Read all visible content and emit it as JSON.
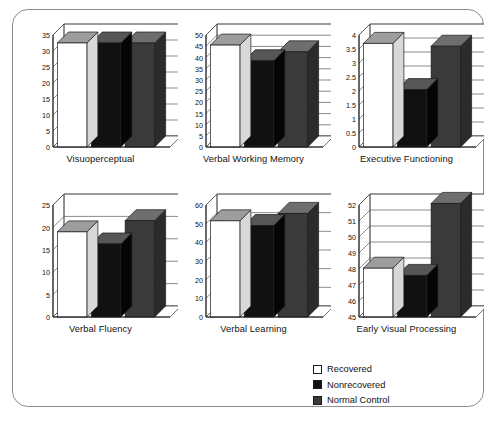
{
  "figure": {
    "legend": {
      "position": "bottom-right",
      "entries": [
        {
          "label": "Recovered",
          "color": "#ffffff"
        },
        {
          "label": "Nonrecovered",
          "color": "#111111"
        },
        {
          "label": "Normal Control",
          "color": "#3a3a3a"
        }
      ]
    }
  },
  "chart_data": [
    {
      "type": "bar",
      "title": "Visuoperceptual",
      "categories": [
        "Recovered",
        "Nonrecovered",
        "Normal Control"
      ],
      "values": [
        32.5,
        32.5,
        32.5
      ],
      "ylim": [
        0,
        35
      ],
      "ytick_step": 5,
      "yticks": [
        0,
        5,
        10,
        15,
        20,
        25,
        30,
        35
      ],
      "xlabel": "",
      "ylabel": "",
      "grid": true,
      "series": [
        {
          "name": "Recovered",
          "values": [
            32.5
          ]
        },
        {
          "name": "Nonrecovered",
          "values": [
            32.5
          ]
        },
        {
          "name": "Normal Control",
          "values": [
            32.5
          ]
        }
      ]
    },
    {
      "type": "bar",
      "title": "Verbal Working Memory",
      "categories": [
        "Recovered",
        "Nonrecovered",
        "Normal Control"
      ],
      "values": [
        45.5,
        38.5,
        42.5
      ],
      "ylim": [
        0,
        50
      ],
      "ytick_step": 5,
      "yticks": [
        0,
        5,
        10,
        15,
        20,
        25,
        30,
        35,
        40,
        45,
        50
      ],
      "xlabel": "",
      "ylabel": "",
      "grid": true,
      "series": [
        {
          "name": "Recovered",
          "values": [
            45.5
          ]
        },
        {
          "name": "Nonrecovered",
          "values": [
            38.5
          ]
        },
        {
          "name": "Normal Control",
          "values": [
            42.5
          ]
        }
      ]
    },
    {
      "type": "bar",
      "title": "Executive Functioning",
      "categories": [
        "Recovered",
        "Nonrecovered",
        "Normal Control"
      ],
      "values": [
        3.7,
        2.05,
        3.6
      ],
      "ylim": [
        0,
        4
      ],
      "ytick_step": 0.5,
      "yticks": [
        0,
        0.5,
        1,
        1.5,
        2,
        2.5,
        3,
        3.5,
        4
      ],
      "xlabel": "",
      "ylabel": "",
      "grid": true,
      "series": [
        {
          "name": "Recovered",
          "values": [
            3.7
          ]
        },
        {
          "name": "Nonrecovered",
          "values": [
            2.05
          ]
        },
        {
          "name": "Normal Control",
          "values": [
            3.6
          ]
        }
      ]
    },
    {
      "type": "bar",
      "title": "Verbal Fluency",
      "categories": [
        "Recovered",
        "Nonrecovered",
        "Normal Control"
      ],
      "values": [
        19,
        16.3,
        21.5
      ],
      "ylim": [
        0,
        25
      ],
      "ytick_step": 5,
      "yticks": [
        0,
        5,
        10,
        15,
        20,
        25
      ],
      "xlabel": "",
      "ylabel": "",
      "grid": true,
      "series": [
        {
          "name": "Recovered",
          "values": [
            19
          ]
        },
        {
          "name": "Nonrecovered",
          "values": [
            16.3
          ]
        },
        {
          "name": "Normal Control",
          "values": [
            21.5
          ]
        }
      ]
    },
    {
      "type": "bar",
      "title": "Verbal Learning",
      "categories": [
        "Recovered",
        "Nonrecovered",
        "Normal Control"
      ],
      "values": [
        51.5,
        49,
        55.5
      ],
      "ylim": [
        0,
        60
      ],
      "ytick_step": 10,
      "yticks": [
        0,
        10,
        20,
        30,
        40,
        50,
        60
      ],
      "xlabel": "",
      "ylabel": "",
      "grid": true,
      "series": [
        {
          "name": "Recovered",
          "values": [
            51.5
          ]
        },
        {
          "name": "Nonrecovered",
          "values": [
            49
          ]
        },
        {
          "name": "Normal Control",
          "values": [
            55.5
          ]
        }
      ]
    },
    {
      "type": "bar",
      "title": "Early Visual Processing",
      "categories": [
        "Recovered",
        "Nonrecovered",
        "Normal Control"
      ],
      "values": [
        48.05,
        47.6,
        52.1
      ],
      "ylim": [
        45,
        52
      ],
      "ytick_step": 1,
      "yticks": [
        45,
        46,
        47,
        48,
        49,
        50,
        51,
        52
      ],
      "xlabel": "",
      "ylabel": "",
      "grid": true,
      "series": [
        {
          "name": "Recovered",
          "values": [
            48.05
          ]
        },
        {
          "name": "Nonrecovered",
          "values": [
            47.6
          ]
        },
        {
          "name": "Normal Control",
          "values": [
            52.1
          ]
        }
      ]
    }
  ]
}
